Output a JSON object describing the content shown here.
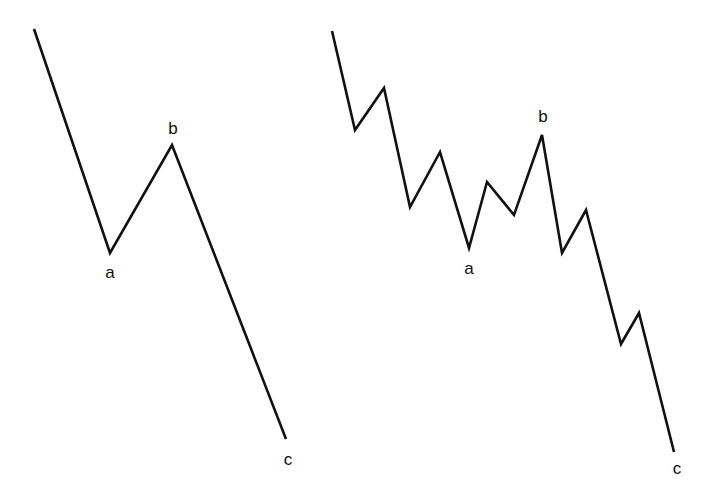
{
  "diagram": {
    "type": "wave-pattern",
    "stroke_color": "#111111",
    "background": "#ffffff",
    "panels": [
      {
        "name": "simple-abc-correction",
        "points": [
          [
            34,
            29
          ],
          [
            110,
            253
          ],
          [
            172,
            145
          ],
          [
            286,
            439
          ]
        ],
        "labels": [
          {
            "text": "a",
            "x": 110,
            "y": 278
          },
          {
            "text": "b",
            "x": 173,
            "y": 134
          },
          {
            "text": "c",
            "x": 288,
            "y": 465
          }
        ]
      },
      {
        "name": "subdivided-abc-correction",
        "points": [
          [
            332,
            31
          ],
          [
            355,
            130
          ],
          [
            384,
            88
          ],
          [
            410,
            207
          ],
          [
            440,
            152
          ],
          [
            469,
            248
          ],
          [
            487,
            182
          ],
          [
            514,
            215
          ],
          [
            542,
            135
          ],
          [
            562,
            253
          ],
          [
            586,
            210
          ],
          [
            621,
            344
          ],
          [
            639,
            313
          ],
          [
            674,
            452
          ]
        ],
        "labels": [
          {
            "text": "a",
            "x": 469,
            "y": 274
          },
          {
            "text": "b",
            "x": 543,
            "y": 122
          },
          {
            "text": "c",
            "x": 677,
            "y": 474
          }
        ]
      }
    ]
  }
}
